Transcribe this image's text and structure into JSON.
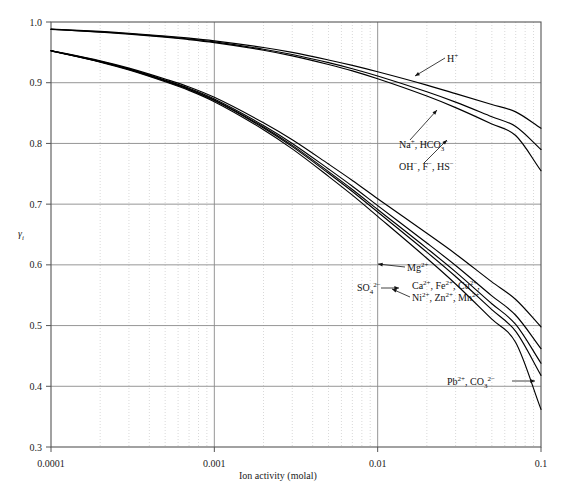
{
  "chart_data": {
    "type": "line",
    "title": "",
    "subtitle": "",
    "xlabel": "Ion activity (molal)",
    "ylabel": "γi",
    "xscale": "log",
    "yscale": "linear",
    "xlim": [
      0.0001,
      0.1
    ],
    "ylim": [
      0.3,
      1.0
    ],
    "xticks": [
      0.0001,
      0.001,
      0.01,
      0.1
    ],
    "xtick_labels": [
      "0.0001",
      "0.001",
      "0.01",
      "0.1"
    ],
    "yticks": [
      0.3,
      0.4,
      0.5,
      0.6,
      0.7,
      0.8,
      0.9,
      1.0
    ],
    "ytick_labels": [
      "0.3",
      "0.4",
      "0.5",
      "0.6",
      "0.7",
      "0.8",
      "0.9",
      "1.0"
    ],
    "grid": "major solid, log-minor dotted",
    "legend": "inline annotations with leader lines",
    "x": [
      0.0001,
      0.0002,
      0.0003,
      0.0005,
      0.0007,
      0.001,
      0.002,
      0.003,
      0.005,
      0.007,
      0.01,
      0.02,
      0.03,
      0.05,
      0.07,
      0.1
    ],
    "series": [
      {
        "name": "H+",
        "label": "H⁺",
        "charge": 1,
        "values": [
          0.9885,
          0.9845,
          0.9815,
          0.977,
          0.9735,
          0.969,
          0.958,
          0.95,
          0.9375,
          0.9285,
          0.918,
          0.896,
          0.882,
          0.864,
          0.852,
          0.825
        ]
      },
      {
        "name": "Na+, HCO3-",
        "label": "Na⁺, HCO₃⁻",
        "charge": 1,
        "values": [
          0.988,
          0.9838,
          0.9806,
          0.9758,
          0.972,
          0.9672,
          0.9552,
          0.9464,
          0.933,
          0.923,
          0.911,
          0.885,
          0.868,
          0.844,
          0.828,
          0.79
        ]
      },
      {
        "name": "OH-, F-, HS-",
        "label": "OH⁻, F⁻, HS⁻",
        "charge": 1,
        "values": [
          0.9878,
          0.9834,
          0.98,
          0.975,
          0.971,
          0.966,
          0.9535,
          0.9442,
          0.93,
          0.9195,
          0.9065,
          0.878,
          0.859,
          0.832,
          0.813,
          0.755
        ]
      },
      {
        "name": "Mg2+",
        "label": "Mg²⁺",
        "charge": 2,
        "values": [
          0.953,
          0.936,
          0.924,
          0.906,
          0.893,
          0.876,
          0.834,
          0.806,
          0.766,
          0.739,
          0.709,
          0.652,
          0.618,
          0.572,
          0.543,
          0.498
        ]
      },
      {
        "name": "SO4 2-",
        "label": "SO₄²⁻",
        "charge": 2,
        "values": [
          0.9528,
          0.9352,
          0.9228,
          0.9042,
          0.8908,
          0.8732,
          0.8295,
          0.8,
          0.758,
          0.7295,
          0.6975,
          0.636,
          0.599,
          0.549,
          0.517,
          0.462
        ]
      },
      {
        "name": "Ca2+, Fe2+, Cu2+",
        "label": "Ca²⁺, Fe²⁺, Cu²⁺,",
        "charge": 2,
        "values": [
          0.9527,
          0.9348,
          0.9222,
          0.9033,
          0.8896,
          0.8716,
          0.827,
          0.7968,
          0.7536,
          0.7242,
          0.6912,
          0.6272,
          0.5885,
          0.536,
          0.502,
          0.438
        ]
      },
      {
        "name": "Ni2+, Zn2+, Mn2+",
        "label": "Ni²⁺, Zn²⁺, Mn²⁺",
        "charge": 2,
        "values": [
          0.9526,
          0.9345,
          0.9218,
          0.9027,
          0.8888,
          0.8706,
          0.8254,
          0.7947,
          0.7508,
          0.7208,
          0.687,
          0.621,
          0.5808,
          0.5262,
          0.4905,
          0.418
        ]
      },
      {
        "name": "Pb2+, CO3 2-",
        "label": "Pb²⁺, CO₃²⁻",
        "charge": 2,
        "values": [
          0.9524,
          0.934,
          0.921,
          0.9016,
          0.8874,
          0.8688,
          0.8226,
          0.791,
          0.7458,
          0.7148,
          0.6798,
          0.6108,
          0.5685,
          0.5105,
          0.472,
          0.362
        ]
      }
    ],
    "annotations": [
      {
        "id": "ann-h",
        "text": "H⁺",
        "for": "H+"
      },
      {
        "id": "ann-na",
        "text": "Na⁺, HCO₃⁻",
        "for": "Na+, HCO3-"
      },
      {
        "id": "ann-oh",
        "text": "OH⁻, F⁻, HS⁻",
        "for": "OH-, F-, HS-"
      },
      {
        "id": "ann-mg",
        "text": "Mg²⁺",
        "for": "Mg2+"
      },
      {
        "id": "ann-so4",
        "text": "SO₄²⁻",
        "for": "SO4 2-"
      },
      {
        "id": "ann-ca",
        "text": "Ca²⁺, Fe²⁺, Cu²⁺,",
        "for": "Ca2+, Fe2+, Cu2+"
      },
      {
        "id": "ann-ni",
        "text": "Ni²⁺, Zn²⁺, Mn²⁺",
        "for": "Ni2+, Zn2+, Mn2+"
      },
      {
        "id": "ann-pb",
        "text": "Pb²⁺, CO₃²⁻",
        "for": "Pb2+, CO3 2-"
      }
    ],
    "colors": {
      "curve": "#000000",
      "major_grid": "#8a8a8a",
      "minor_grid": "#c8c8c8",
      "axis": "#555555",
      "background": "#ffffff"
    }
  }
}
